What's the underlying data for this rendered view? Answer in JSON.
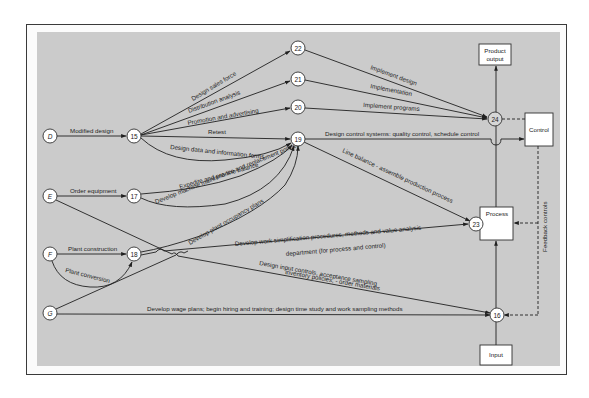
{
  "nodes": {
    "D": "D",
    "E": "E",
    "F": "F",
    "G": "G",
    "n15": "15",
    "n16": "16",
    "n17": "17",
    "n18": "18",
    "n19": "19",
    "n20": "20",
    "n21": "21",
    "n22": "22",
    "n23": "23",
    "n24": "24"
  },
  "boxes": {
    "product_output_line1": "Product",
    "product_output_line2": "output",
    "control": "Control",
    "process": "Process",
    "input": "Input"
  },
  "edges": {
    "modified_design": "Modified design",
    "design_sales_force": "Design sales force",
    "distribution_analysis": "Distribution analysis",
    "promotion_advertising": "Promotion and advertising",
    "retest": "Retest",
    "design_data_forms": "Design data and information forms",
    "implement_design": "Implement design",
    "implementation": "Implementation",
    "implement_programs": "Implement programs",
    "design_control_systems": "Design control systems: quality control, schedule control",
    "line_balance": "Line balance - assemble production process",
    "order_equipment": "Order equipment",
    "expedite": "Expedite and pre-line balance",
    "machine_maintenance": "Develop machine maintenance and replacement policies",
    "plant_occupancy": "Develop plant occupancy plans",
    "plant_construction": "Plant construction",
    "plant_conversion": "Plant conversion",
    "work_simplification_1": "Develop work simplification procedures, methods and value analysis",
    "work_simplification_2": "department (for process and control)",
    "input_controls_1": "Design input controls, acceptance sampling",
    "input_controls_2": "inventory policies, - order materials",
    "wage_plans": "Develop wage plans; begin hiring and training; design time study and work sampling methods",
    "feedback_controls": "Feedback controls"
  }
}
